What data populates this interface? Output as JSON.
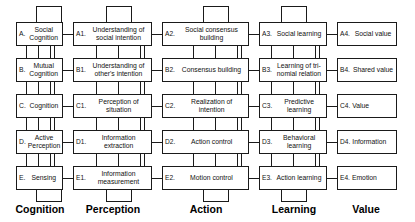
{
  "diagram": {
    "columns": [
      {
        "key": "cognition",
        "caption": "Cognition"
      },
      {
        "key": "perception",
        "caption": "Perception"
      },
      {
        "key": "action",
        "caption": "Action"
      },
      {
        "key": "learning",
        "caption": "Learning"
      },
      {
        "key": "value",
        "caption": "Value"
      }
    ],
    "rows": [
      "A",
      "B",
      "C",
      "D",
      "E"
    ],
    "nodes": {
      "A": {
        "tag": "A.",
        "text": "Social Cognition"
      },
      "A1": {
        "tag": "A1.",
        "text": "Understanding of social intention"
      },
      "A2": {
        "tag": "A2.",
        "text": "Social consensus building"
      },
      "A3": {
        "tag": "A3.",
        "text": "Social learning"
      },
      "A4": {
        "tag": "A4.",
        "text": "Social value"
      },
      "B": {
        "tag": "B.",
        "text": "Mutual Cognition"
      },
      "B1": {
        "tag": "B1.",
        "text": "Understanding of other's intention"
      },
      "B2": {
        "tag": "B2.",
        "text": "Consensus building"
      },
      "B3": {
        "tag": "B3.",
        "text": "Learning of tri-nomial relation"
      },
      "B4": {
        "tag": "B4.",
        "text": "Shared value"
      },
      "C": {
        "tag": "C.",
        "text": "Cognition"
      },
      "C1": {
        "tag": "C1.",
        "text": "Perception of situation"
      },
      "C2": {
        "tag": "C2.",
        "text": "Realization of intention"
      },
      "C3": {
        "tag": "C3.",
        "text": "Predictive learning"
      },
      "C4": {
        "tag": "C4.",
        "text": "Value"
      },
      "D": {
        "tag": "D.",
        "text": "Active Perception"
      },
      "D1": {
        "tag": "D1.",
        "text": "Information extraction"
      },
      "D2": {
        "tag": "D2.",
        "text": "Action control"
      },
      "D3": {
        "tag": "D3.",
        "text": "Behavioral learning"
      },
      "D4": {
        "tag": "D4.",
        "text": "Information"
      },
      "E": {
        "tag": "E.",
        "text": "Sensing"
      },
      "E1": {
        "tag": "E1.",
        "text": "Information measurement"
      },
      "E2": {
        "tag": "E2.",
        "text": "Motion control"
      },
      "E3": {
        "tag": "E3.",
        "text": "Action learning"
      },
      "E4": {
        "tag": "E4.",
        "text": "Emotion"
      }
    },
    "colors": {
      "line": "#1a1a1a",
      "box_fill": "#ffffff",
      "text": "#111111",
      "background": "#ffffff"
    }
  }
}
